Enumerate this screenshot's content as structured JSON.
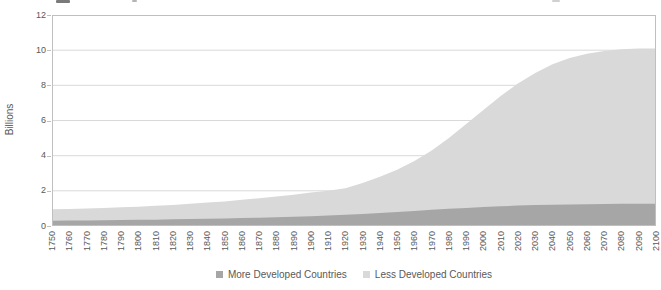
{
  "chart_data": {
    "type": "area",
    "stacked": true,
    "title": "",
    "ylabel": "Billions",
    "ylim": [
      0,
      12
    ],
    "yticks": [
      0,
      2,
      4,
      6,
      8,
      10,
      12
    ],
    "x": [
      1750,
      1760,
      1770,
      1780,
      1790,
      1800,
      1810,
      1820,
      1830,
      1840,
      1850,
      1860,
      1870,
      1880,
      1890,
      1900,
      1910,
      1920,
      1930,
      1940,
      1950,
      1960,
      1970,
      1980,
      1990,
      2000,
      2010,
      2020,
      2030,
      2040,
      2050,
      2060,
      2070,
      2080,
      2090,
      2100
    ],
    "series": [
      {
        "name": "More Developed Countries",
        "color": "#a6a6a6",
        "values": [
          0.3,
          0.31,
          0.32,
          0.33,
          0.34,
          0.35,
          0.36,
          0.38,
          0.39,
          0.41,
          0.43,
          0.45,
          0.47,
          0.5,
          0.53,
          0.56,
          0.6,
          0.64,
          0.69,
          0.74,
          0.8,
          0.86,
          0.92,
          0.98,
          1.03,
          1.08,
          1.12,
          1.16,
          1.19,
          1.21,
          1.23,
          1.24,
          1.25,
          1.26,
          1.27,
          1.27
        ]
      },
      {
        "name": "Less Developed Countries",
        "color": "#d9d9d9",
        "values": [
          0.65,
          0.66,
          0.68,
          0.7,
          0.73,
          0.75,
          0.79,
          0.82,
          0.87,
          0.92,
          0.97,
          1.04,
          1.11,
          1.18,
          1.25,
          1.34,
          1.4,
          1.51,
          1.76,
          2.06,
          2.4,
          2.84,
          3.38,
          4.02,
          4.77,
          5.52,
          6.28,
          6.94,
          7.51,
          7.99,
          8.32,
          8.56,
          8.7,
          8.79,
          8.83,
          8.83
        ]
      }
    ],
    "legend_position": "bottom",
    "gridlines": true,
    "grid_color": "#d9d9d9",
    "border_color": "#bfbfbf",
    "axis_text_color": "#595959"
  }
}
